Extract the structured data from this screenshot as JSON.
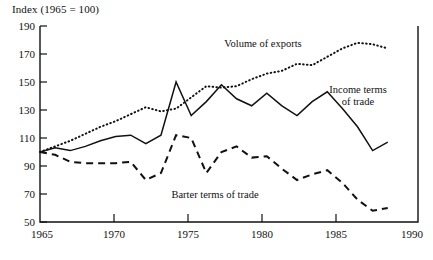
{
  "chart_data": {
    "type": "line",
    "title": "Index (1965 = 100)",
    "xlabel": "",
    "ylabel": "",
    "grid": false,
    "legend_position": "inline-annotations",
    "xlim": [
      1965,
      1990
    ],
    "ylim": [
      50,
      190
    ],
    "xticks": [
      1965,
      1970,
      1975,
      1980,
      1985,
      1990
    ],
    "yticks": [
      50,
      70,
      90,
      110,
      130,
      150,
      170,
      190
    ],
    "x": [
      1965,
      1966,
      1967,
      1968,
      1969,
      1970,
      1971,
      1972,
      1973,
      1974,
      1975,
      1976,
      1977,
      1978,
      1979,
      1980,
      1981,
      1982,
      1983,
      1984,
      1985,
      1986,
      1987,
      1988
    ],
    "series": [
      {
        "name": "Volume of exports",
        "style": "dotted",
        "values": [
          100,
          104,
          108,
          113,
          118,
          122,
          127,
          132,
          129,
          131,
          139,
          147,
          146,
          147,
          152,
          156,
          158,
          163,
          162,
          168,
          174,
          178,
          177,
          174
        ]
      },
      {
        "name": "Income terms of trade",
        "style": "solid",
        "values": [
          100,
          103,
          101,
          104,
          108,
          111,
          112,
          106,
          112,
          150,
          126,
          136,
          148,
          138,
          133,
          142,
          133,
          126,
          136,
          143,
          131,
          118,
          101,
          107
        ]
      },
      {
        "name": "Barter terms of trade",
        "style": "dashed",
        "values": [
          100,
          98,
          93,
          92,
          92,
          92,
          93,
          80,
          85,
          112,
          110,
          85,
          100,
          104,
          96,
          97,
          88,
          80,
          84,
          87,
          78,
          66,
          58,
          60
        ]
      }
    ],
    "annotations": [
      {
        "text": "Volume of exports",
        "series": "Volume of exports"
      },
      {
        "text": "Income terms",
        "series": "Income terms of trade"
      },
      {
        "text": "of trade",
        "series": "Income terms of trade"
      },
      {
        "text": "Barter terms of trade",
        "series": "Barter terms of trade"
      }
    ]
  },
  "axis": {
    "y_tick_labels": [
      "190",
      "170",
      "150",
      "130",
      "110",
      "90",
      "70",
      "50"
    ],
    "x_tick_labels": [
      "1965",
      "1970",
      "1975",
      "1980",
      "1985",
      "1990"
    ]
  },
  "annotations": {
    "volume_of_exports": "Volume of exports",
    "income_terms_line1": "Income terms",
    "income_terms_line2": "of trade",
    "barter_terms": "Barter terms of trade"
  }
}
